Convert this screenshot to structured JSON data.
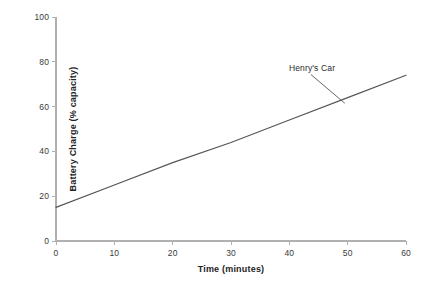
{
  "chart_data": {
    "type": "line",
    "title": "",
    "subtitle": "",
    "xlabel": "Time (minutes)",
    "ylabel": "Battery Charge (% capacity)",
    "xlim": [
      0,
      60
    ],
    "ylim": [
      0,
      100
    ],
    "xticks": [
      0,
      10,
      20,
      30,
      40,
      50,
      60
    ],
    "yticks": [
      0,
      20,
      40,
      60,
      80,
      100
    ],
    "xtick_labels": [
      "0",
      "10",
      "20",
      "30",
      "40",
      "50",
      "60"
    ],
    "ytick_labels": [
      "0",
      "20",
      "40",
      "60",
      "80",
      "100"
    ],
    "grid": false,
    "legend": null,
    "series": [
      {
        "name": "Henry's Car",
        "x": [
          0,
          10,
          20,
          30,
          40,
          50,
          60
        ],
        "values": [
          15,
          25,
          35,
          44,
          54,
          64,
          74
        ],
        "color": "#555555",
        "style": "solid"
      }
    ],
    "annotations": [
      {
        "text": "Henry's Car",
        "label_x": 43.7,
        "label_y": 77.0,
        "target_x": 49.5,
        "target_y": 61.5
      }
    ]
  },
  "axes": {
    "axis_color": "#b0b0b0",
    "tick_color": "#b0b0b0",
    "label_color": "#3a3a3a",
    "title_color": "#232323",
    "background": "#ffffff"
  }
}
